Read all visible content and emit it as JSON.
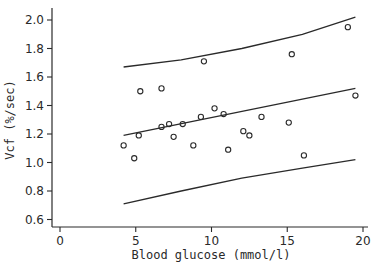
{
  "chart_data": {
    "type": "scatter",
    "title": "",
    "xlabel": "Blood glucose (mmol/l)",
    "ylabel": "Vcf (%/sec)",
    "xlim": [
      -0.1,
      20.3
    ],
    "ylim": [
      0.55,
      2.05
    ],
    "xticks": [
      0,
      5,
      10,
      15,
      20
    ],
    "xtick_labels": [
      "0",
      "5",
      "10",
      "15",
      "20"
    ],
    "yticks": [
      0.6,
      0.8,
      1.0,
      1.2,
      1.4,
      1.6,
      1.8,
      2.0
    ],
    "ytick_labels": [
      "0.6",
      "0.8",
      "1.0",
      "1.2",
      "1.4",
      "1.6",
      "1.8",
      "2.0"
    ],
    "grid": false,
    "legend": null,
    "series": [
      {
        "name": "observations",
        "marker": "open-circle",
        "points": [
          {
            "x": 4.2,
            "y": 1.12
          },
          {
            "x": 4.9,
            "y": 1.03
          },
          {
            "x": 5.2,
            "y": 1.19
          },
          {
            "x": 5.3,
            "y": 1.5
          },
          {
            "x": 6.7,
            "y": 1.52
          },
          {
            "x": 6.7,
            "y": 1.25
          },
          {
            "x": 7.2,
            "y": 1.27
          },
          {
            "x": 7.5,
            "y": 1.18
          },
          {
            "x": 8.1,
            "y": 1.27
          },
          {
            "x": 8.8,
            "y": 1.12
          },
          {
            "x": 9.3,
            "y": 1.32
          },
          {
            "x": 9.5,
            "y": 1.71
          },
          {
            "x": 10.2,
            "y": 1.38
          },
          {
            "x": 10.8,
            "y": 1.34
          },
          {
            "x": 11.1,
            "y": 1.09
          },
          {
            "x": 12.1,
            "y": 1.22
          },
          {
            "x": 12.5,
            "y": 1.19
          },
          {
            "x": 13.3,
            "y": 1.32
          },
          {
            "x": 15.1,
            "y": 1.28
          },
          {
            "x": 15.3,
            "y": 1.76
          },
          {
            "x": 16.1,
            "y": 1.05
          },
          {
            "x": 19.0,
            "y": 1.95
          },
          {
            "x": 19.5,
            "y": 1.47
          }
        ]
      },
      {
        "name": "regression line",
        "type": "line",
        "points": [
          {
            "x": 4.2,
            "y": 1.19
          },
          {
            "x": 19.5,
            "y": 1.52
          }
        ]
      },
      {
        "name": "upper prediction limit",
        "type": "line",
        "points": [
          {
            "x": 4.2,
            "y": 1.67
          },
          {
            "x": 8.0,
            "y": 1.72
          },
          {
            "x": 12.0,
            "y": 1.8
          },
          {
            "x": 16.0,
            "y": 1.9
          },
          {
            "x": 19.5,
            "y": 2.02
          }
        ]
      },
      {
        "name": "lower prediction limit",
        "type": "line",
        "points": [
          {
            "x": 4.2,
            "y": 0.71
          },
          {
            "x": 8.0,
            "y": 0.8
          },
          {
            "x": 12.0,
            "y": 0.89
          },
          {
            "x": 16.0,
            "y": 0.96
          },
          {
            "x": 19.5,
            "y": 1.02
          }
        ]
      }
    ]
  },
  "colors": {
    "ink": "#2a2a2a",
    "background": "#ffffff"
  }
}
